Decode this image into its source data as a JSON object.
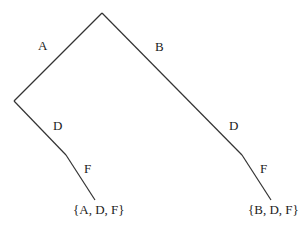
{
  "diagram": {
    "type": "tree",
    "edges": [
      {
        "label": "A",
        "from": "root",
        "to": "nA"
      },
      {
        "label": "B",
        "from": "root",
        "to": "nB"
      },
      {
        "label": "D",
        "from": "nA",
        "to": "nAD"
      },
      {
        "label": "F",
        "from": "nAD",
        "to": "leafADF"
      },
      {
        "label": "D",
        "from": "nB",
        "to": "nBD"
      },
      {
        "label": "F",
        "from": "nBD",
        "to": "leafBDF"
      }
    ],
    "leaves": [
      {
        "id": "leafADF",
        "label": "{A, D, F}"
      },
      {
        "id": "leafBDF",
        "label": "{B, D, F}"
      }
    ]
  }
}
